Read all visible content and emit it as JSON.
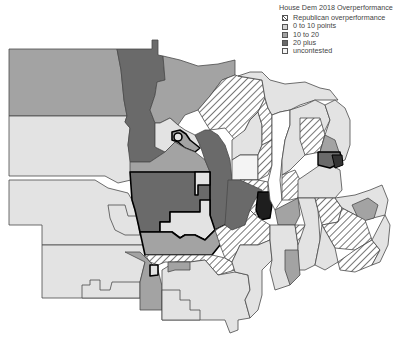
{
  "legend": {
    "title": "House Dem 2018 Overperformance",
    "items": [
      {
        "label": "Republican overperformance",
        "color": "#ffffff",
        "pattern": "hatch"
      },
      {
        "label": "0 to 10 points",
        "color": "#d4d4d4",
        "pattern": "solid"
      },
      {
        "label": "10 to 20",
        "color": "#a3a3a3",
        "pattern": "solid"
      },
      {
        "label": "20 plus",
        "color": "#6a6a6a",
        "pattern": "solid"
      },
      {
        "label": "uncontested",
        "color": "#eeeeee",
        "pattern": "solid"
      }
    ]
  },
  "colors": {
    "background": "#ffffff",
    "border": "#4a4a4a",
    "highlight_border": "#000000",
    "lake": "#ffffff"
  }
}
